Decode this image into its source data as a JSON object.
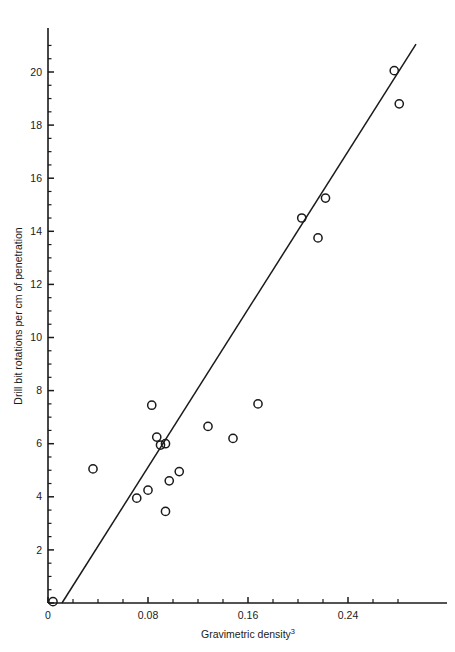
{
  "chart_data": {
    "type": "scatter",
    "title": "",
    "xlabel": "Gravimetric density³",
    "ylabel": "Drill bit rotations per cm of penetration",
    "xlim": [
      0,
      0.2976
    ],
    "ylim": [
      0,
      21.4
    ],
    "grid": false,
    "legend": null,
    "x_ticks_major": [
      0,
      0.08,
      0.16,
      0.24
    ],
    "x_tick_labels": [
      "0",
      "0.08",
      "0.16",
      "0.24"
    ],
    "x_tick_minor_step": 0.02,
    "y_ticks_major": [
      0,
      2,
      4,
      6,
      8,
      10,
      12,
      14,
      16,
      18,
      20
    ],
    "y_tick_labels": [
      "0",
      "2",
      "4",
      "6",
      "8",
      "10",
      "12",
      "14",
      "16",
      "18",
      "20"
    ],
    "y_tick_minor_step": 0.5,
    "marker": "open-circle",
    "marker_color": "#1a1a1a",
    "points": [
      {
        "x": 0.004,
        "y": 0.05
      },
      {
        "x": 0.036,
        "y": 5.05
      },
      {
        "x": 0.071,
        "y": 3.95
      },
      {
        "x": 0.08,
        "y": 4.25
      },
      {
        "x": 0.083,
        "y": 7.45
      },
      {
        "x": 0.087,
        "y": 6.25
      },
      {
        "x": 0.09,
        "y": 5.95
      },
      {
        "x": 0.094,
        "y": 6.0
      },
      {
        "x": 0.094,
        "y": 3.45
      },
      {
        "x": 0.097,
        "y": 4.6
      },
      {
        "x": 0.105,
        "y": 4.95
      },
      {
        "x": 0.128,
        "y": 6.65
      },
      {
        "x": 0.148,
        "y": 6.2
      },
      {
        "x": 0.168,
        "y": 7.5
      },
      {
        "x": 0.203,
        "y": 14.5
      },
      {
        "x": 0.216,
        "y": 13.75
      },
      {
        "x": 0.222,
        "y": 15.25
      },
      {
        "x": 0.277,
        "y": 20.05
      },
      {
        "x": 0.281,
        "y": 18.8
      }
    ],
    "fit_line": {
      "label": "least-squares regression line",
      "x_start": 0.0112,
      "y_start": 0.0,
      "x_end": 0.2944,
      "y_end": 21.05
    },
    "annotations": []
  }
}
